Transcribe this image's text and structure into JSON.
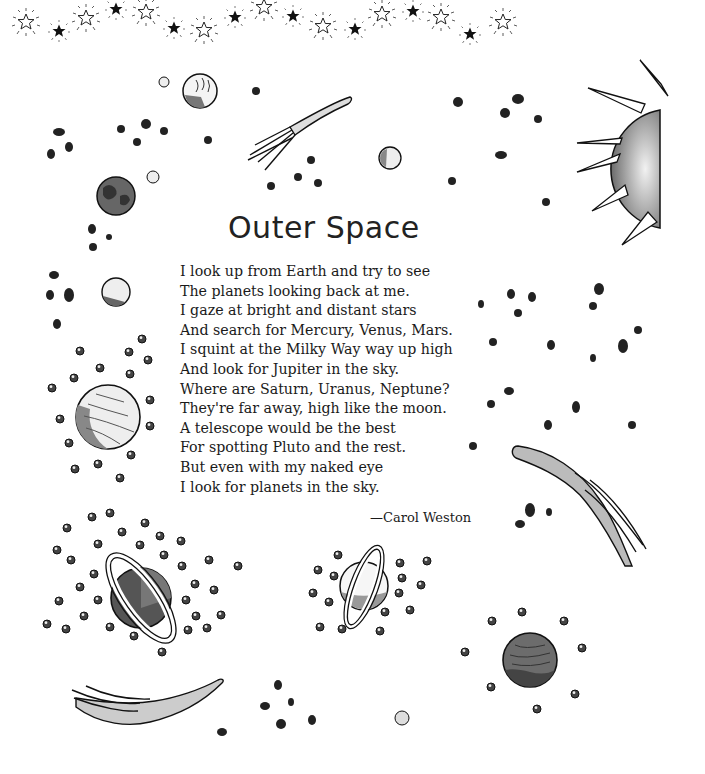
{
  "poem": {
    "title": "Outer Space",
    "lines": [
      "I look up from Earth and try to see",
      "The planets looking back at me.",
      "I gaze at bright and distant stars",
      "And search for Mercury, Venus, Mars.",
      "I squint at the Milky Way way up high",
      "And look for Jupiter in the sky.",
      "Where are Saturn, Uranus, Neptune?",
      "They're far away, high like the moon.",
      "A telescope would be the best",
      "For spotting Pluto and the rest.",
      "But even with my naked eye",
      "I look for planets in the sky."
    ],
    "author": "—Carol Weston"
  },
  "decorations": {
    "border_stars": [
      "outline-star",
      "filled-star",
      "outline-star",
      "filled-star",
      "outline-star",
      "filled-star",
      "outline-star",
      "filled-star",
      "outline-star",
      "filled-star",
      "outline-star",
      "filled-star",
      "outline-star",
      "filled-star",
      "outline-star",
      "filled-star",
      "outline-star",
      "filled-star"
    ],
    "illustrations": [
      "sun",
      "comet",
      "earth",
      "moon",
      "jupiter",
      "saturn",
      "uranus",
      "mars",
      "asteroids",
      "stars"
    ]
  },
  "colors": {
    "ink": "#1a1a1a",
    "planet_dark": "#555555",
    "planet_mid": "#8a8a8a",
    "background": "#ffffff"
  }
}
